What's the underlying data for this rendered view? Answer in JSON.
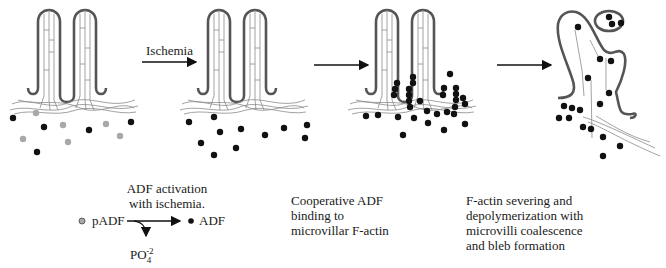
{
  "diagram": {
    "type": "process-schematic",
    "panels": [
      {
        "id": "panel-1",
        "description": "Intact microvilli with mixed pADF (grey) and ADF (black) in cytosol"
      },
      {
        "id": "panel-2",
        "description": "After ischemia: all ADF activated (black dots) below intact microvilli"
      },
      {
        "id": "panel-3",
        "description": "ADF binds cooperatively to microvillar F-actin cores"
      },
      {
        "id": "panel-4",
        "description": "Microvilli coalesce, F-actin depolymerized, bleb formed"
      }
    ],
    "arrows": [
      {
        "from": "panel-1",
        "to": "panel-2",
        "label": "Ischemia"
      },
      {
        "from": "panel-2",
        "to": "panel-3",
        "label": ""
      },
      {
        "from": "panel-3",
        "to": "panel-4",
        "label": ""
      }
    ],
    "colors": {
      "outline": "#555555",
      "filament": "#777777",
      "adf": "#111111",
      "padf": "#a8a8a8"
    }
  },
  "arrow_label": "Ischemia",
  "captions": {
    "activation_line1": "ADF activation",
    "activation_line2": "with ischemia.",
    "binding_line1": "Cooperative ADF",
    "binding_line2": "binding to",
    "binding_line3": "microvillar F-actin",
    "severing_line1": "F-actin severing and",
    "severing_line2": "depolymerization with",
    "severing_line3": "microvilli coalescence",
    "severing_line4": "and bleb formation"
  },
  "equation": {
    "reactant": "pADF",
    "product": "ADF",
    "byproduct_base": "PO",
    "byproduct_sub": "4",
    "byproduct_sup": "-2"
  }
}
